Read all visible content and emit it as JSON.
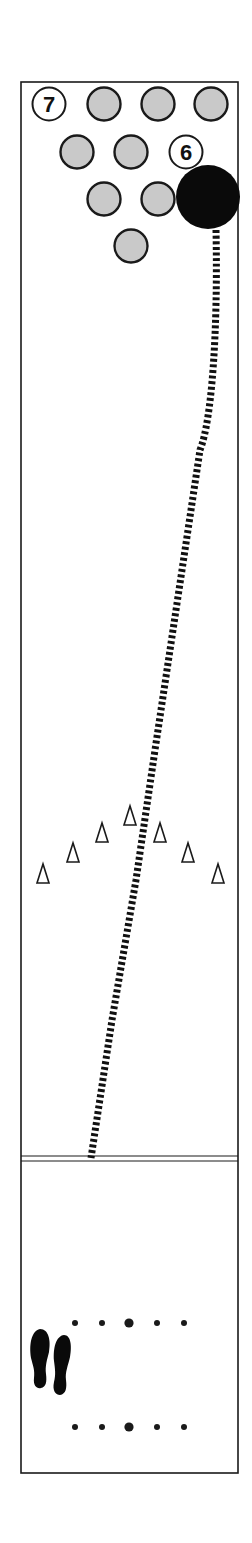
{
  "diagram": {
    "colors": {
      "line": "#1a1a1a",
      "pin_fill": "#c9c9c9",
      "pin_standing_fill": "#ffffff",
      "ball": "#0a0a0a",
      "background": "#ffffff"
    },
    "lane": {
      "left": 21,
      "right": 238,
      "top": 82,
      "bottom": 1473,
      "foul_line_y": 1156
    },
    "pins": [
      {
        "id": "pin-7",
        "cx": 49,
        "cy": 104,
        "standing": true,
        "label": "7"
      },
      {
        "id": "pin-8",
        "cx": 104,
        "cy": 104,
        "standing": false,
        "label": ""
      },
      {
        "id": "pin-9",
        "cx": 158,
        "cy": 104,
        "standing": false,
        "label": ""
      },
      {
        "id": "pin-10",
        "cx": 211,
        "cy": 104,
        "standing": false,
        "label": ""
      },
      {
        "id": "pin-4",
        "cx": 77,
        "cy": 152,
        "standing": false,
        "label": ""
      },
      {
        "id": "pin-5",
        "cx": 131,
        "cy": 152,
        "standing": false,
        "label": ""
      },
      {
        "id": "pin-6",
        "cx": 186,
        "cy": 152,
        "standing": true,
        "label": "6"
      },
      {
        "id": "pin-2",
        "cx": 104,
        "cy": 199,
        "standing": false,
        "label": ""
      },
      {
        "id": "pin-3",
        "cx": 158,
        "cy": 199,
        "standing": false,
        "label": ""
      },
      {
        "id": "pin-1",
        "cx": 131,
        "cy": 246,
        "standing": false,
        "label": ""
      }
    ],
    "ball": {
      "cx": 208,
      "cy": 197,
      "r": 32
    },
    "ball_path": "M 216 230 C 218 330, 212 420, 200 450 L 155 750 L 136 880 L 112 1020 L 91 1158",
    "arrows": [
      {
        "x": 43,
        "top": 864
      },
      {
        "x": 73,
        "top": 843
      },
      {
        "x": 102,
        "top": 823
      },
      {
        "x": 130,
        "top": 806
      },
      {
        "x": 160,
        "top": 823
      },
      {
        "x": 188,
        "top": 843
      },
      {
        "x": 218,
        "top": 864
      }
    ],
    "approach_dots": [
      {
        "y": 1323,
        "xs": [
          75,
          102,
          129,
          157,
          184
        ],
        "big_index": 2
      },
      {
        "y": 1427,
        "xs": [
          75,
          102,
          129,
          157,
          184
        ],
        "big_index": 2
      }
    ],
    "footprints": [
      {
        "id": "left-foot",
        "x": 40,
        "y": 1358
      },
      {
        "id": "right-foot",
        "x": 62,
        "y": 1365
      }
    ]
  }
}
